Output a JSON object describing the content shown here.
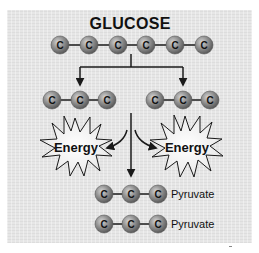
{
  "diagram": {
    "title": "GLUCOSE",
    "atom_label": "C",
    "glucose_chain": {
      "atoms": [
        "C",
        "C",
        "C",
        "C",
        "C",
        "C"
      ]
    },
    "split_chains": [
      {
        "side": "left",
        "atoms": [
          "C",
          "C",
          "C"
        ]
      },
      {
        "side": "right",
        "atoms": [
          "C",
          "C",
          "C"
        ]
      }
    ],
    "energy_bursts": [
      {
        "side": "left",
        "label": "Energy"
      },
      {
        "side": "right",
        "label": "Energy"
      }
    ],
    "products": [
      {
        "atoms": [
          "C",
          "C",
          "C"
        ],
        "label": "Pyruvate"
      },
      {
        "atoms": [
          "C",
          "C",
          "C"
        ],
        "label": "Pyruvate"
      }
    ],
    "colors": {
      "background_panel": "#e6e6e6",
      "atom_fill": "#8a8a8a",
      "atom_highlight": "#d0d0d0",
      "line": "#1a1a1a",
      "burst_fill": "#f2f2f2"
    }
  }
}
